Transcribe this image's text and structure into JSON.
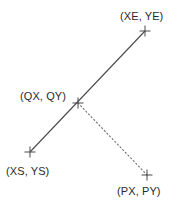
{
  "diagram": {
    "type": "line-projection-geometry",
    "background_color": "#ffffff",
    "stroke_color": "#4a4a4a",
    "text_color": "#2b2b2b",
    "points": [
      {
        "id": "start",
        "label": "(XS, YS)",
        "marker": "cross-marker",
        "x": 30,
        "y": 152,
        "label_x": 6,
        "label_y": 165
      },
      {
        "id": "query",
        "label": "(QX, QY)",
        "marker": "cross-marker",
        "x": 78,
        "y": 103,
        "label_x": 20,
        "label_y": 90
      },
      {
        "id": "end",
        "label": "(XE, YE)",
        "marker": "cross-marker",
        "x": 145,
        "y": 31,
        "label_x": 120,
        "label_y": 10
      },
      {
        "id": "projected",
        "label": "(PX, PY)",
        "marker": "cross-marker",
        "x": 147,
        "y": 175,
        "label_x": 117,
        "label_y": 185
      }
    ],
    "segments": [
      {
        "id": "main-segment",
        "style": "solid",
        "from": "start",
        "to": "end",
        "x1": 30,
        "y1": 152,
        "x2": 145,
        "y2": 31
      },
      {
        "id": "projection-segment",
        "style": "dotted",
        "from": "query",
        "to": "projected",
        "x1": 78,
        "y1": 103,
        "x2": 147,
        "y2": 175
      }
    ],
    "marker_half_size": 5.5
  }
}
